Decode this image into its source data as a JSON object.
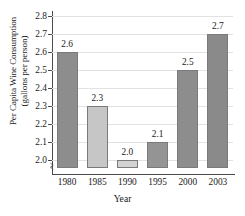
{
  "chart_data": {
    "type": "bar",
    "title": "",
    "categories": [
      "1980",
      "1985",
      "1990",
      "1995",
      "2000",
      "2003"
    ],
    "values": [
      2.6,
      2.3,
      2.0,
      2.1,
      2.5,
      2.7
    ],
    "value_labels": [
      "2.6",
      "2.3",
      "2.0",
      "2.1",
      "2.5",
      "2.7"
    ],
    "bar_colors": [
      "#8d8d8d",
      "#c6c6c6",
      "#d2d2d2",
      "#949494",
      "#8d8d8d",
      "#8a8a8a"
    ],
    "xlabel": "Year",
    "ylabel_line1": "Per Capita Wine Consumption",
    "ylabel_line2": "(gallons per person)",
    "ylim": [
      2.0,
      2.8
    ],
    "ytick_values": [
      2.8,
      2.7,
      2.6,
      2.5,
      2.4,
      2.3,
      2.2,
      2.1,
      2.0
    ],
    "ytick_labels": [
      "2.8",
      "2.7",
      "2.6",
      "2.5",
      "2.4",
      "2.3",
      "2.2",
      "2.1",
      "2.0"
    ],
    "grid": true,
    "legend": "none",
    "axis_break": true,
    "gridline_color": "#e2e2e2",
    "axis_color": "#4a4a4a",
    "text_color": "#1a1a1a",
    "background": "#ffffff"
  }
}
